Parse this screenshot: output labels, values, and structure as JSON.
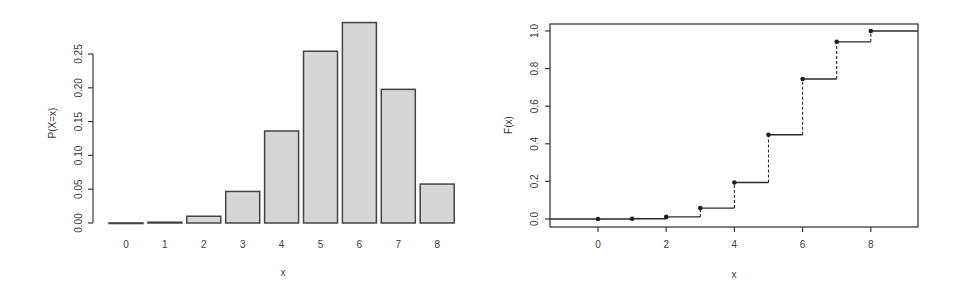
{
  "chart_data": [
    {
      "type": "bar",
      "title": "",
      "xlabel": "x",
      "ylabel": "P(X=x)",
      "categories": [
        "0",
        "1",
        "2",
        "3",
        "4",
        "5",
        "6",
        "7",
        "8"
      ],
      "values": [
        0.0001,
        0.0012,
        0.01,
        0.0467,
        0.1361,
        0.2541,
        0.2965,
        0.1977,
        0.0576
      ],
      "ylim": [
        0,
        0.25
      ],
      "yticks": [
        "0.00",
        "0.05",
        "0.10",
        "0.15",
        "0.20",
        "0.25"
      ],
      "ytick_values": [
        0,
        0.05,
        0.1,
        0.15,
        0.2,
        0.25
      ],
      "grid": false,
      "fill_color": "#d6d6d6",
      "edge_color": "#444444"
    },
    {
      "type": "line",
      "subtype": "step",
      "title": "",
      "xlabel": "x",
      "ylabel": "F(x)",
      "x": [
        0,
        1,
        2,
        3,
        4,
        5,
        6,
        7,
        8
      ],
      "values": [
        0.0001,
        0.0013,
        0.0113,
        0.058,
        0.1941,
        0.4482,
        0.7447,
        0.9424,
        1.0
      ],
      "xlim": [
        -1.4,
        9.5
      ],
      "ylim": [
        -0.04,
        1.04
      ],
      "xticks": [
        "0",
        "2",
        "4",
        "6",
        "8"
      ],
      "xtick_values": [
        0,
        2,
        4,
        6,
        8
      ],
      "yticks": [
        "0.0",
        "0.2",
        "0.4",
        "0.6",
        "0.8",
        "1.0"
      ],
      "ytick_values": [
        0,
        0.2,
        0.4,
        0.6,
        0.8,
        1.0
      ],
      "grid": false,
      "line_color": "#2a2a2a"
    }
  ]
}
